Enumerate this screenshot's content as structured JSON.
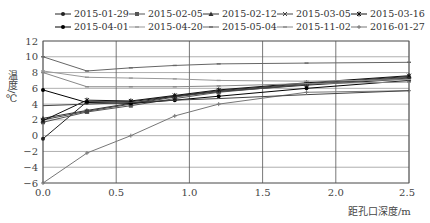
{
  "chart_data": {
    "type": "line",
    "title": "",
    "xlabel": "距孔口深度/m",
    "ylabel": "温度/℃",
    "xlim": [
      0,
      2.5
    ],
    "ylim": [
      -6,
      12
    ],
    "xticks": [
      "0.0",
      "0.5",
      "1.0",
      "1.5",
      "2.0",
      "2.5"
    ],
    "yticks": [
      "12",
      "10",
      "8",
      "6",
      "4",
      "2",
      "0",
      "−2",
      "−4",
      "−6"
    ],
    "grid": true,
    "legend_position": "top",
    "x": [
      0.0,
      0.3,
      0.6,
      0.9,
      1.2,
      1.8,
      2.5
    ],
    "series": [
      {
        "name": "2015-01-29",
        "color": "#222222",
        "marker": "dot",
        "values": [
          -0.4,
          4.3,
          4.3,
          5.0,
          5.6,
          6.4,
          7.2
        ]
      },
      {
        "name": "2015-02-05",
        "color": "#555555",
        "marker": "square",
        "values": [
          1.7,
          3.0,
          3.8,
          4.7,
          5.5,
          6.5,
          7.4
        ]
      },
      {
        "name": "2015-02-12",
        "color": "#333333",
        "marker": "triangle",
        "values": [
          2.2,
          3.2,
          4.1,
          5.0,
          5.7,
          6.6,
          7.5
        ]
      },
      {
        "name": "2015-03-05",
        "color": "#444444",
        "marker": "x",
        "values": [
          2.0,
          3.1,
          4.0,
          4.9,
          5.6,
          6.5,
          7.3
        ]
      },
      {
        "name": "2015-03-16",
        "color": "#111111",
        "marker": "star",
        "values": [
          1.9,
          4.5,
          4.4,
          5.1,
          5.8,
          6.7,
          7.6
        ]
      },
      {
        "name": "2015-04-01",
        "color": "#000000",
        "marker": "dot",
        "values": [
          5.8,
          4.2,
          4.1,
          4.5,
          5.0,
          6.0,
          7.0
        ]
      },
      {
        "name": "2015-04-20",
        "color": "#999999",
        "marker": "dash",
        "values": [
          8.2,
          7.4,
          7.3,
          7.2,
          7.0,
          6.9,
          7.1
        ]
      },
      {
        "name": "2015-05-04",
        "color": "#666666",
        "marker": "dash",
        "values": [
          10.0,
          8.2,
          8.6,
          8.9,
          9.1,
          9.2,
          9.3
        ]
      },
      {
        "name": "2015-11-02",
        "color": "#888888",
        "marker": "dash",
        "values": [
          8.0,
          6.2,
          6.2,
          6.2,
          6.3,
          6.6,
          6.8
        ]
      },
      {
        "name": "2016-01-27",
        "color": "#777777",
        "marker": "plus",
        "values": [
          -6.0,
          -2.2,
          0.0,
          2.5,
          4.0,
          5.5,
          5.7
        ]
      }
    ],
    "extra_series_note": "A horizontal series near 3.8 °C also visible",
    "baseline_series": {
      "name": "",
      "color": "#444444",
      "values": [
        3.8,
        4.0,
        4.2,
        4.5,
        4.7,
        5.2,
        5.7
      ]
    }
  },
  "axis": {
    "xlabel": "距孔口深度/m",
    "ylabel": "温度/℃"
  }
}
